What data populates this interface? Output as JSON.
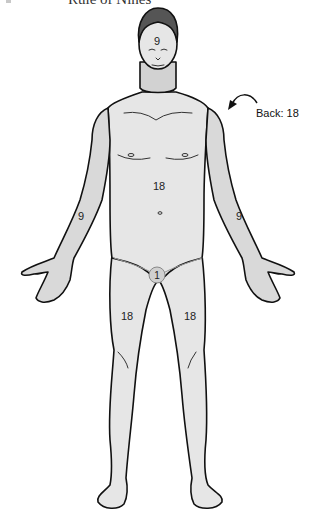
{
  "title": "Rule of Nines",
  "colors": {
    "skin_fill": "#e6e6e6",
    "neck_fill": "#d2d2d2",
    "arm_fill": "#d9d9d9",
    "hair_fill": "#555555",
    "outline": "#111111",
    "genital_circle": "#d0d0d0"
  },
  "regions": [
    {
      "name": "head",
      "label": "9"
    },
    {
      "name": "anterior-trunk",
      "label": "18"
    },
    {
      "name": "right-arm",
      "label": "9"
    },
    {
      "name": "left-arm",
      "label": "9"
    },
    {
      "name": "perineum",
      "label": "1"
    },
    {
      "name": "right-leg",
      "label": "18"
    },
    {
      "name": "left-leg",
      "label": "18"
    }
  ],
  "back": {
    "label": "Back: 18",
    "arrow_icon": "curved-arrow-icon"
  }
}
